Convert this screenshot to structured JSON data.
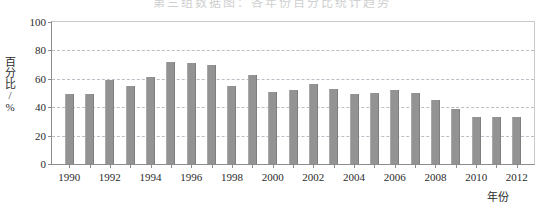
{
  "title_strip": "第三组数据图：各年份百分比统计趋势",
  "chart_data": {
    "type": "bar",
    "title": "",
    "subtitle": "",
    "xlabel": "年份",
    "ylabel": "百分比/%",
    "ylim": [
      0,
      100
    ],
    "ytick_labels": [
      "0",
      "20",
      "40",
      "60",
      "80",
      "100"
    ],
    "ytick_values": [
      0,
      20,
      40,
      60,
      80,
      100
    ],
    "grid": true,
    "grid_axis": "y",
    "legend": null,
    "legend_position": "none",
    "bar_color": "#939393",
    "x": [
      1990,
      1991,
      1992,
      1993,
      1994,
      1995,
      1996,
      1997,
      1998,
      1999,
      2000,
      2001,
      2002,
      2003,
      2004,
      2005,
      2006,
      2007,
      2008,
      2009,
      2010,
      2011,
      2012
    ],
    "categories": [
      "1990",
      "1991",
      "1992",
      "1993",
      "1994",
      "1995",
      "1996",
      "1997",
      "1998",
      "1999",
      "2000",
      "2001",
      "2002",
      "2003",
      "2004",
      "2005",
      "2006",
      "2007",
      "2008",
      "2009",
      "2010",
      "2011",
      "2012"
    ],
    "xtick_labels": [
      "1990",
      "1992",
      "1994",
      "1996",
      "1998",
      "2000",
      "2002",
      "2004",
      "2006",
      "2008",
      "2010",
      "2012"
    ],
    "xtick_values": [
      1990,
      1992,
      1994,
      1996,
      1998,
      2000,
      2002,
      2004,
      2006,
      2008,
      2010,
      2012
    ],
    "values": [
      49,
      49,
      59,
      55,
      61,
      72,
      71,
      70,
      55,
      63,
      51,
      52,
      56,
      53,
      49,
      50,
      52,
      50,
      45,
      39,
      33,
      33,
      33
    ],
    "series": [
      {
        "name": "百分比",
        "values": [
          49,
          49,
          59,
          55,
          61,
          72,
          71,
          70,
          55,
          63,
          51,
          52,
          56,
          53,
          49,
          50,
          52,
          50,
          45,
          39,
          33,
          33,
          33
        ]
      }
    ],
    "annotations": []
  }
}
